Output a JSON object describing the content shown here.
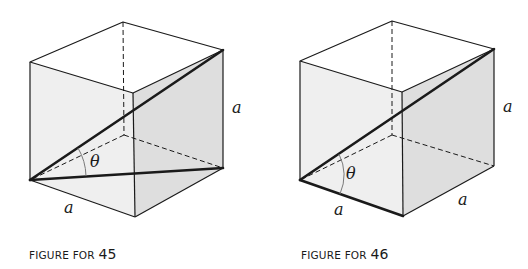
{
  "figures": [
    {
      "id": "45",
      "caption_prefix": "FIGURE FOR",
      "caption_number": "45",
      "edge_label_right": "a",
      "edge_label_bottom": "a",
      "angle_label": "θ",
      "diagonal_description": "space diagonal from bottom-left-front to top-right; face diagonal on bottom face"
    },
    {
      "id": "46",
      "caption_prefix": "FIGURE FOR",
      "caption_number": "46",
      "edge_label_right": "a",
      "edge_label_bottom_left": "a",
      "edge_label_bottom_right": "a",
      "angle_label": "θ",
      "diagonal_description": "space diagonal from bottom-left to top-right; bottom front edge emphasized"
    }
  ],
  "colors": {
    "line": "#1a1a1a",
    "face_left": "#efefef",
    "face_right": "#dedede",
    "face_top": "#ffffff",
    "angle_arc": "#7a7a7a"
  }
}
